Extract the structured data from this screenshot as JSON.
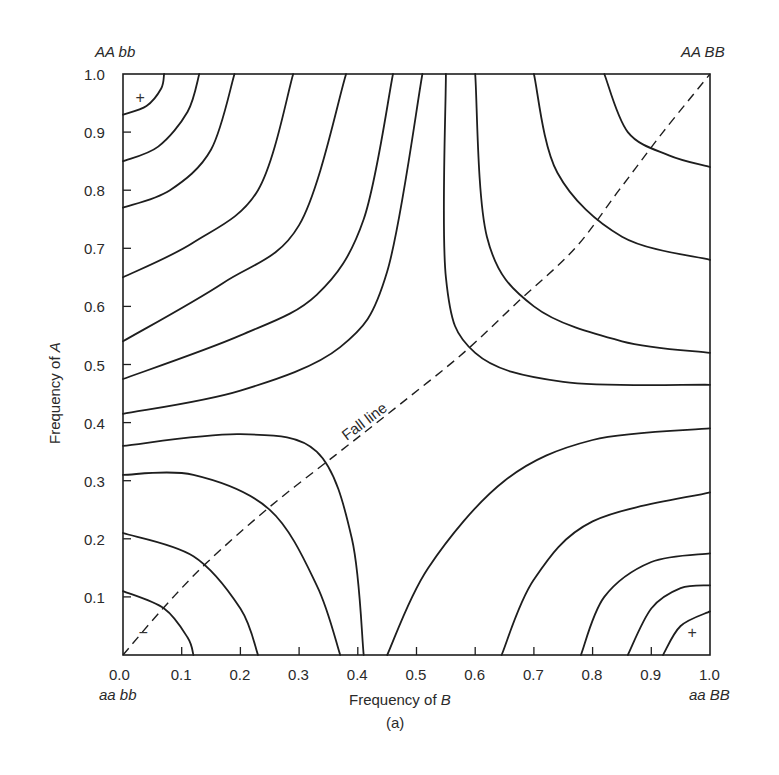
{
  "chart_data": {
    "type": "contour",
    "title": "",
    "caption": "(a)",
    "xlabel": "Frequency of B",
    "xlabel_prefix": "Frequency of ",
    "xlabel_var": "B",
    "ylabel": "Frequency of A",
    "ylabel_prefix": "Frequency of ",
    "ylabel_var": "A",
    "xlim": [
      0.0,
      1.0
    ],
    "ylim": [
      0.0,
      1.0
    ],
    "x_ticks": [
      "0.0",
      "0.1",
      "0.2",
      "0.3",
      "0.4",
      "0.5",
      "0.6",
      "0.7",
      "0.8",
      "0.9",
      "1.0"
    ],
    "y_ticks": [
      "0.0",
      "0.1",
      "0.2",
      "0.3",
      "0.4",
      "0.5",
      "0.6",
      "0.7",
      "0.8",
      "0.9",
      "1.0"
    ],
    "grid": false,
    "corner_labels": {
      "top_left": "AA bb",
      "top_right": "AA BB",
      "bottom_left": "aa bb",
      "bottom_right": "aa BB"
    },
    "peak_markers": [
      {
        "symbol": "+",
        "x": 0.03,
        "y": 0.96,
        "meaning": "adaptive peak"
      },
      {
        "symbol": "+",
        "x": 0.97,
        "y": 0.04,
        "meaning": "adaptive peak"
      },
      {
        "symbol": "−",
        "x": 0.035,
        "y": 0.04,
        "meaning": "adaptive valley"
      }
    ],
    "annotation": {
      "text": "Fall line",
      "x": 0.48,
      "y": 0.42,
      "rotation": -37
    },
    "fall_line": [
      [
        0,
        0
      ],
      [
        0.068,
        0.08
      ],
      [
        0.143,
        0.159
      ],
      [
        0.25,
        0.255
      ],
      [
        0.363,
        0.345
      ],
      [
        0.47,
        0.43
      ],
      [
        0.58,
        0.52
      ],
      [
        0.675,
        0.61
      ],
      [
        0.77,
        0.7
      ],
      [
        0.845,
        0.8
      ],
      [
        0.92,
        0.9
      ],
      [
        1,
        1
      ]
    ],
    "contours": [
      [
        [
          0,
          0.93
        ],
        [
          0.04,
          0.945
        ],
        [
          0.065,
          0.975
        ],
        [
          0.07,
          1.0
        ]
      ],
      [
        [
          0,
          0.85
        ],
        [
          0.06,
          0.875
        ],
        [
          0.11,
          0.935
        ],
        [
          0.13,
          1.0
        ]
      ],
      [
        [
          0,
          0.77
        ],
        [
          0.08,
          0.8
        ],
        [
          0.15,
          0.87
        ],
        [
          0.19,
          1.0
        ]
      ],
      [
        [
          0,
          0.65
        ],
        [
          0.12,
          0.71
        ],
        [
          0.23,
          0.8
        ],
        [
          0.29,
          1.0
        ]
      ],
      [
        [
          0,
          0.54
        ],
        [
          0.17,
          0.64
        ],
        [
          0.3,
          0.74
        ],
        [
          0.38,
          1.0
        ]
      ],
      [
        [
          0,
          0.475
        ],
        [
          0.2,
          0.55
        ],
        [
          0.33,
          0.62
        ],
        [
          0.41,
          0.75
        ],
        [
          0.46,
          1.0
        ]
      ],
      [
        [
          0,
          0.415
        ],
        [
          0.2,
          0.455
        ],
        [
          0.37,
          0.53
        ],
        [
          0.45,
          0.66
        ],
        [
          0.51,
          1.0
        ]
      ],
      [
        [
          0.55,
          1.0
        ],
        [
          0.55,
          0.65
        ],
        [
          0.6,
          0.52
        ],
        [
          0.75,
          0.47
        ],
        [
          1,
          0.465
        ]
      ],
      [
        [
          0.6,
          1.0
        ],
        [
          0.62,
          0.72
        ],
        [
          0.7,
          0.6
        ],
        [
          0.85,
          0.54
        ],
        [
          1,
          0.52
        ]
      ],
      [
        [
          0.7,
          1.0
        ],
        [
          0.74,
          0.83
        ],
        [
          0.85,
          0.72
        ],
        [
          1,
          0.68
        ]
      ],
      [
        [
          0.82,
          1.0
        ],
        [
          0.86,
          0.9
        ],
        [
          0.93,
          0.86
        ],
        [
          1,
          0.84
        ]
      ],
      [
        [
          0,
          0.36
        ],
        [
          0.2,
          0.38
        ],
        [
          0.33,
          0.35
        ],
        [
          0.39,
          0.2
        ],
        [
          0.41,
          0
        ]
      ],
      [
        [
          0,
          0.31
        ],
        [
          0.12,
          0.31
        ],
        [
          0.25,
          0.25
        ],
        [
          0.33,
          0.12
        ],
        [
          0.37,
          0
        ]
      ],
      [
        [
          0,
          0.21
        ],
        [
          0.12,
          0.17
        ],
        [
          0.2,
          0.08
        ],
        [
          0.23,
          0
        ]
      ],
      [
        [
          0,
          0.11
        ],
        [
          0.07,
          0.08
        ],
        [
          0.11,
          0.03
        ],
        [
          0.12,
          0
        ]
      ],
      [
        [
          0.45,
          0
        ],
        [
          0.52,
          0.15
        ],
        [
          0.65,
          0.3
        ],
        [
          0.8,
          0.37
        ],
        [
          1,
          0.39
        ]
      ],
      [
        [
          0.645,
          0
        ],
        [
          0.7,
          0.13
        ],
        [
          0.8,
          0.23
        ],
        [
          1,
          0.28
        ]
      ],
      [
        [
          0.78,
          0
        ],
        [
          0.82,
          0.1
        ],
        [
          0.9,
          0.16
        ],
        [
          1,
          0.175
        ]
      ],
      [
        [
          0.86,
          0
        ],
        [
          0.9,
          0.08
        ],
        [
          0.95,
          0.115
        ],
        [
          1,
          0.12
        ]
      ],
      [
        [
          0.92,
          0
        ],
        [
          0.95,
          0.05
        ],
        [
          1,
          0.075
        ]
      ]
    ]
  },
  "colors": {
    "ink": "#1e1e1e",
    "background": "#ffffff"
  }
}
